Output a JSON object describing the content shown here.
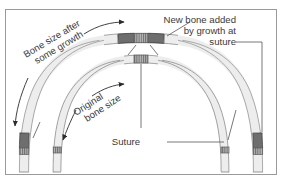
{
  "figure": {
    "background": "#ffffff",
    "border_color": "#9a9a9a"
  },
  "labels": {
    "new_bone_line1": "New bone added",
    "new_bone_line2": "by growth at",
    "new_bone_line3": "suture",
    "bone_after_line1": "Bone size after",
    "bone_after_line2": "some growth",
    "original_line1": "Original",
    "original_line2": "bone size",
    "suture": "Suture"
  },
  "colors": {
    "bone_fill": "#ededed",
    "bone_outline": "#808080",
    "new_bone_fill": "#6e6e6e",
    "suture_fill": "#b4b4b4",
    "suture_hatch": "#707070",
    "leader_line": "#555555",
    "text": "#3a3a3a",
    "arrow": "#2b2b2b"
  },
  "elements": {
    "outer_arc_name": "bone-after-growth-arc",
    "inner_arc_name": "original-bone-arc",
    "apex_suture_name": "suture-band-apex",
    "growth_arrows": 4
  }
}
